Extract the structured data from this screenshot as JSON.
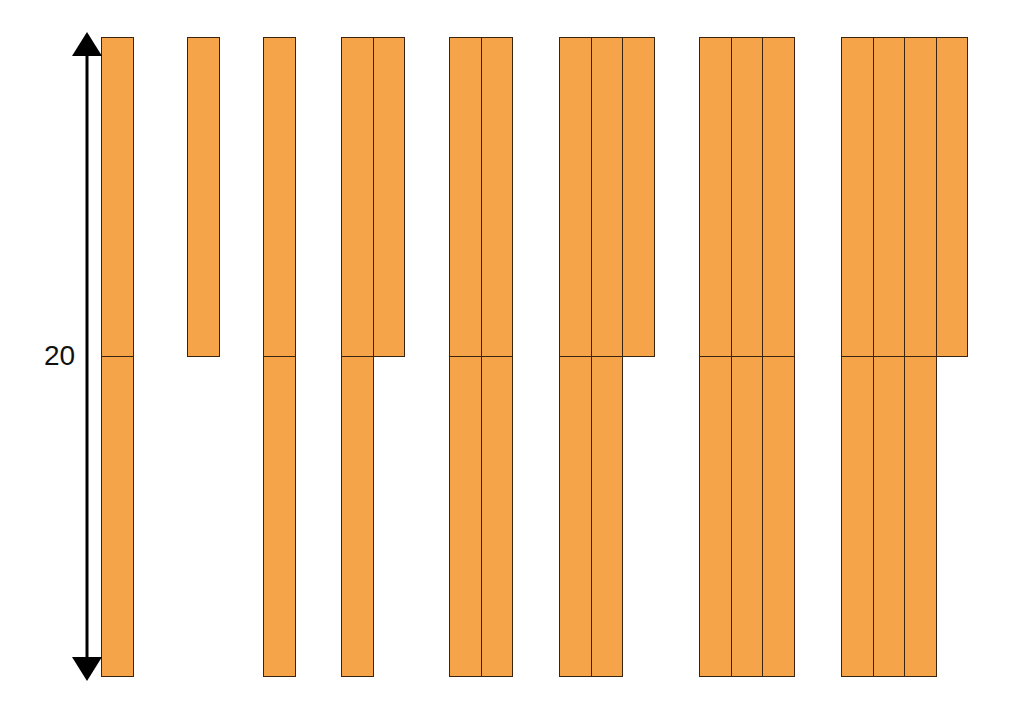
{
  "diagram": {
    "title": "",
    "dimension_label": "20",
    "rod_color": "#f5a449",
    "outline_color": "#3a2410",
    "arrow": {
      "x": 87,
      "y_top": 37,
      "y_bottom": 676
    },
    "geometry": {
      "top": 37,
      "mid": 356,
      "bottom": 676,
      "col_width": 31.5
    },
    "groups": [
      {
        "x": 101,
        "top_cols": 1,
        "bottom_cols": 1
      },
      {
        "x": 187,
        "top_cols": 1,
        "bottom_cols": 0
      },
      {
        "x": 263,
        "top_cols": 1,
        "bottom_cols": 1
      },
      {
        "x": 341,
        "top_cols": 2,
        "bottom_cols": 1
      },
      {
        "x": 449,
        "top_cols": 2,
        "bottom_cols": 2
      },
      {
        "x": 559,
        "top_cols": 3,
        "bottom_cols": 2
      },
      {
        "x": 699,
        "top_cols": 3,
        "bottom_cols": 3
      },
      {
        "x": 841,
        "top_cols": 4,
        "bottom_cols": 3
      }
    ]
  }
}
